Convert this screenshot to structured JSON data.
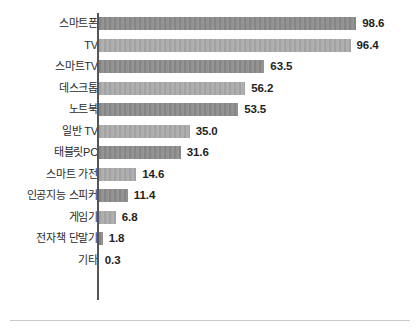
{
  "chart_data": {
    "type": "bar",
    "orientation": "horizontal",
    "title": "",
    "subtitle": "",
    "xlabel": "",
    "ylabel": "",
    "grid": false,
    "legend": false,
    "xlim": [
      0,
      100
    ],
    "axis_line_color": "#555555",
    "bar_color_dark": "#8b8b8b",
    "bar_color_light": "#a9a9a9",
    "background_color": "#ffffff",
    "value_label_color": "#1f1f1f",
    "category_label_color": "#2b2b2b",
    "categories": [
      "스마트폰",
      "TV",
      "스마트TV",
      "데스크톱",
      "노트북",
      "일반 TV",
      "태블릿PC",
      "스마트 가전",
      "인공지능 스피커",
      "게임기",
      "전자책 단말기",
      "기타"
    ],
    "values": [
      98.6,
      96.4,
      63.5,
      56.2,
      53.5,
      35.0,
      31.6,
      14.6,
      11.4,
      6.8,
      1.8,
      0.3
    ],
    "value_labels": [
      "98.6",
      "96.4",
      "63.5",
      "56.2",
      "53.5",
      "35.0",
      "31.6",
      "14.6",
      "11.4",
      "6.8",
      "1.8",
      "0.3"
    ],
    "bar_shades": [
      "dark",
      "light",
      "dark",
      "light",
      "dark",
      "light",
      "dark",
      "light",
      "dark",
      "light",
      "dark",
      "light"
    ]
  }
}
